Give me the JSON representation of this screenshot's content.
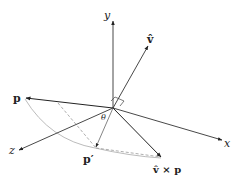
{
  "diagram": {
    "labels": {
      "y_axis": "y",
      "x_axis": "x",
      "z_axis": "z",
      "v_hat": "v̂",
      "p": "p",
      "p_prime": "p′",
      "cross": "v̂ × p",
      "theta": "θ"
    },
    "colors": {
      "axis": "#333333",
      "vector": "#222222",
      "arc": "#aaaaaa",
      "dashed": "#888888"
    }
  }
}
